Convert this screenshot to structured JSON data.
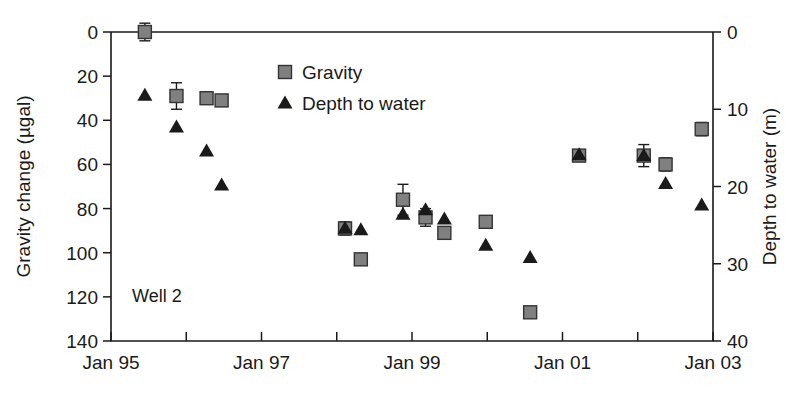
{
  "figure": {
    "annotation": "Well 2",
    "background": "#ffffff"
  },
  "legend": {
    "position": "top-center",
    "entries": [
      {
        "label": "Gravity",
        "marker": "square",
        "color": "#808080",
        "edge": "#333333"
      },
      {
        "label": "Depth to water",
        "marker": "triangle",
        "color": "#1a1a1a",
        "edge": "#1a1a1a"
      }
    ]
  },
  "axes": {
    "left": {
      "title": "Gravity change (µgal)",
      "ticks": [
        0,
        20,
        40,
        60,
        80,
        100,
        120,
        140
      ],
      "tick_labels": [
        "0",
        "20",
        "40",
        "60",
        "80",
        "100",
        "120",
        "140"
      ],
      "range": [
        0,
        140
      ],
      "inverted": true
    },
    "right": {
      "title": "Depth to water (m)",
      "ticks": [
        0,
        10,
        20,
        30,
        40
      ],
      "tick_labels": [
        "0",
        "10",
        "20",
        "30",
        "40"
      ],
      "range": [
        0,
        40
      ],
      "inverted": true
    },
    "bottom": {
      "title": "",
      "major_tick_labels": [
        "Jan 95",
        "Jan 97",
        "Jan 99",
        "Jan 01",
        "Jan 03"
      ],
      "major_tick_years": [
        1995,
        1997,
        1999,
        2001,
        2003
      ],
      "minor_tick_years": [
        1996,
        1998,
        2000,
        2002
      ],
      "range": [
        1995,
        2003
      ]
    }
  },
  "chart_data": {
    "type": "scatter",
    "title": "",
    "xlabel": "",
    "ylabel": "Gravity change (µgal)",
    "y2label": "Depth to water (m)",
    "xlim": [
      1995,
      2003
    ],
    "ylim": [
      0,
      140
    ],
    "y2lim": [
      0,
      40
    ],
    "y_inverted": true,
    "grid": false,
    "legend_position": "top-center",
    "annotation": "Well 2",
    "xtick_labels": [
      "Jan 95",
      "Jan 97",
      "Jan 99",
      "Jan 01",
      "Jan 03"
    ],
    "series": [
      {
        "name": "Gravity",
        "axis": "left",
        "units": "µgal",
        "marker": "square",
        "color": "#808080",
        "points": [
          {
            "x": 1995.45,
            "y": 0,
            "yerr": 4
          },
          {
            "x": 1995.87,
            "y": 29,
            "yerr": 6
          },
          {
            "x": 1996.27,
            "y": 30,
            "yerr": 0
          },
          {
            "x": 1996.47,
            "y": 31,
            "yerr": 0
          },
          {
            "x": 1998.11,
            "y": 89,
            "yerr": 3
          },
          {
            "x": 1998.32,
            "y": 103,
            "yerr": 0
          },
          {
            "x": 1998.88,
            "y": 76,
            "yerr": 7
          },
          {
            "x": 1999.18,
            "y": 84,
            "yerr": 4
          },
          {
            "x": 1999.43,
            "y": 91,
            "yerr": 0
          },
          {
            "x": 1999.98,
            "y": 86,
            "yerr": 0
          },
          {
            "x": 2000.57,
            "y": 127,
            "yerr": 0
          },
          {
            "x": 2001.22,
            "y": 56,
            "yerr": 2
          },
          {
            "x": 2002.08,
            "y": 56,
            "yerr": 5
          },
          {
            "x": 2002.37,
            "y": 60,
            "yerr": 3
          },
          {
            "x": 2002.85,
            "y": 44,
            "yerr": 3
          }
        ]
      },
      {
        "name": "Depth to water",
        "axis": "right",
        "units": "m",
        "marker": "triangle",
        "color": "#1a1a1a",
        "points": [
          {
            "x": 1995.45,
            "y": 8.2
          },
          {
            "x": 1995.87,
            "y": 12.3
          },
          {
            "x": 1996.27,
            "y": 15.4
          },
          {
            "x": 1996.47,
            "y": 19.8
          },
          {
            "x": 1998.11,
            "y": 25.4
          },
          {
            "x": 1998.32,
            "y": 25.6
          },
          {
            "x": 1998.88,
            "y": 23.6
          },
          {
            "x": 1999.18,
            "y": 23.0
          },
          {
            "x": 1999.43,
            "y": 24.2
          },
          {
            "x": 1999.98,
            "y": 27.6
          },
          {
            "x": 2000.57,
            "y": 29.2
          },
          {
            "x": 2001.22,
            "y": 15.9
          },
          {
            "x": 2002.08,
            "y": 16.0
          },
          {
            "x": 2002.37,
            "y": 19.6
          },
          {
            "x": 2002.85,
            "y": 22.4
          }
        ]
      }
    ]
  }
}
